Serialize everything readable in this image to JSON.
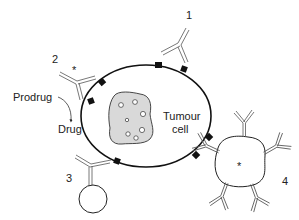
{
  "diagram": {
    "type": "schematic",
    "cell": {
      "label_line1": "Tumour",
      "label_line2": "cell",
      "membrane_color": "#111111",
      "nucleus_fill": "#d9d9d9",
      "antigen_color": "#111111"
    },
    "approaches": [
      {
        "number": "1",
        "description": "Naked antibody binding a surface antigen"
      },
      {
        "number": "2",
        "description": "Antibody conjugated to enzyme (*) converting prodrug to drug",
        "marker": "*"
      },
      {
        "number": "3",
        "description": "Antibody conjugated to a sphere (carrier)"
      },
      {
        "number": "4",
        "description": "Liposome (*) coated with multiple antibodies",
        "marker": "*"
      }
    ],
    "labels": {
      "n1": "1",
      "n2": "2",
      "n3": "3",
      "n4": "4",
      "asterisk2": "*",
      "asterisk4": "*",
      "prodrug": "Prodrug",
      "drug": "Drug"
    }
  }
}
